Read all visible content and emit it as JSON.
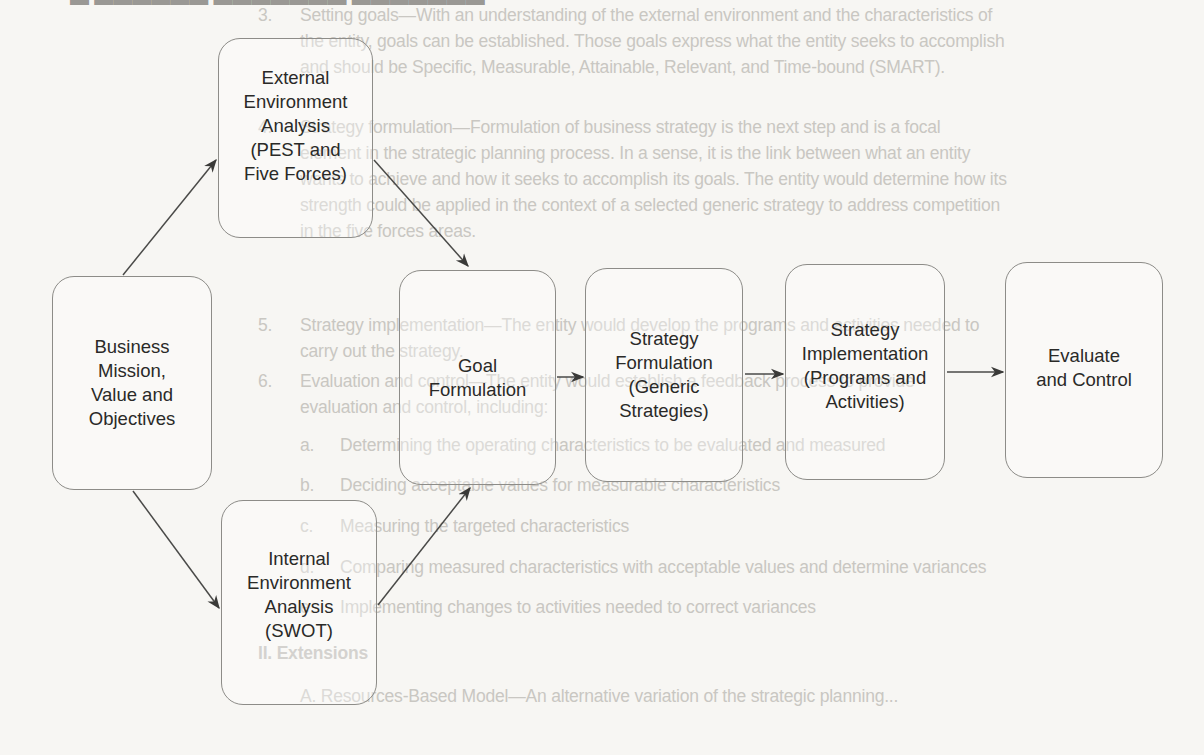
{
  "diagram": {
    "title_fragment": "Strategic planning process",
    "nodes": [
      {
        "id": "mission",
        "label": "Business\nMission,\nValue and\nObjectives"
      },
      {
        "id": "external",
        "label": "External\nEnvironment\nAnalysis\n(PEST and\nFive Forces)"
      },
      {
        "id": "internal",
        "label": "Internal\nEnvironment\nAnalysis\n(SWOT)"
      },
      {
        "id": "goal",
        "label": "Goal\nFormulation"
      },
      {
        "id": "strategy_formulation",
        "label": "Strategy\nFormulation\n(Generic\nStrategies)"
      },
      {
        "id": "strategy_implementation",
        "label": "Strategy\nImplementation\n(Programs and\nActivities)"
      },
      {
        "id": "evaluate",
        "label": "Evaluate\nand Control"
      }
    ],
    "edges": [
      {
        "from": "mission",
        "to": "external"
      },
      {
        "from": "mission",
        "to": "internal"
      },
      {
        "from": "external",
        "to": "goal"
      },
      {
        "from": "internal",
        "to": "goal"
      },
      {
        "from": "goal",
        "to": "strategy_formulation"
      },
      {
        "from": "strategy_formulation",
        "to": "strategy_implementation"
      },
      {
        "from": "strategy_implementation",
        "to": "evaluate"
      }
    ]
  },
  "background_text": {
    "item3_num": "3.",
    "item3_lines": [
      "Setting goals—With an understanding of the external environment and the characteristics of",
      "the entity, goals can be established. Those goals express what the entity seeks to accomplish",
      "and should be Specific, Measurable, Attainable, Relevant, and Time-bound (SMART)."
    ],
    "item4_num": "4.",
    "item4_lines": [
      "Strategy formulation—Formulation of business strategy is the next step and is a focal",
      "element in the strategic planning process. In a sense, it is the link between what an entity",
      "wants to achieve and how it seeks to accomplish its goals. The entity would determine how its",
      "strength could be applied in the context of a selected generic strategy to address competition",
      "in the five forces areas."
    ],
    "item5_num": "5.",
    "item5_lines": [
      "Strategy implementation—The entity would develop the programs and activities needed to",
      "carry out the strategy."
    ],
    "item6_num": "6.",
    "item6_lines": [
      "Evaluation and control—The entity would establish a feedback process to provide",
      "evaluation and control, including:"
    ],
    "subitems": [
      {
        "letter": "a.",
        "text": "Determining the operating characteristics to be evaluated and measured"
      },
      {
        "letter": "b.",
        "text": "Deciding acceptable values for measurable characteristics"
      },
      {
        "letter": "c.",
        "text": "Measuring the targeted characteristics"
      },
      {
        "letter": "d.",
        "text": "Comparing measured characteristics with acceptable values and determine variances"
      },
      {
        "letter": "e.",
        "text": "Implementing changes to activities needed to correct variances"
      }
    ],
    "section_ii": "II.   Extensions",
    "section_a": "A.   Resources-Based Model—An alternative variation of the strategic planning..."
  }
}
